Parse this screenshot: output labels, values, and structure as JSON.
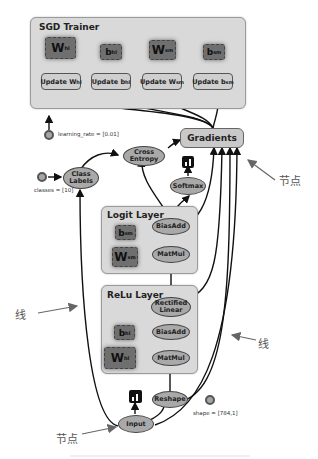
{
  "sgd_trainer": {
    "title": "SGD Trainer",
    "variables": [
      {
        "base": "W",
        "sub": "hl"
      },
      {
        "base": "b",
        "sub": "hl"
      },
      {
        "base": "W",
        "sub": "sm"
      },
      {
        "base": "b",
        "sub": "sm"
      }
    ],
    "updates": [
      {
        "label": "Update W",
        "sub": "hl"
      },
      {
        "label": "Update b",
        "sub": "hl"
      },
      {
        "label": "Update W",
        "sub": "sm"
      },
      {
        "label": "Update b",
        "sub": "sm"
      }
    ]
  },
  "learning_rate": "learning_rate = [0.01]",
  "gradients": "Gradients",
  "cross_entropy": "Cross Entropy",
  "class_labels": "Class Labels",
  "classes": "classes = [10]",
  "softmax": "Softmax",
  "logit_layer": {
    "title": "Logit Layer",
    "bias": {
      "base": "b",
      "sub": "sm"
    },
    "weight": {
      "base": "W",
      "sub": "sm"
    },
    "biasadd": "BiasAdd",
    "matmul": "MatMul"
  },
  "relu_layer": {
    "title": "ReLu Layer",
    "rectified": "Rectified Linear",
    "bias": {
      "base": "b",
      "sub": "hl"
    },
    "weight": {
      "base": "W",
      "sub": "hl"
    },
    "biasadd": "BiasAdd",
    "matmul": "MatMul"
  },
  "reshape": "Reshape",
  "shape": "shape = [784,1]",
  "input": "Input",
  "annotations": {
    "node_top": "节点",
    "line_left": "线",
    "line_right": "线",
    "node_bottom": "节点"
  },
  "colors": {
    "group_bg": "#d9d9d9",
    "variable": "#6f6f6f",
    "op": "#a9a9a9",
    "edge": "#111111",
    "annotation_arrow": "#666666"
  }
}
